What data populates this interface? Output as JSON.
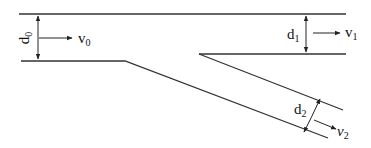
{
  "diagram": {
    "type": "branching channel flow",
    "labels": {
      "d0": {
        "main": "d",
        "sub": "0"
      },
      "v0": {
        "main": "v",
        "sub": "0"
      },
      "d1": {
        "main": "d",
        "sub": "1"
      },
      "v1": {
        "main": "v",
        "sub": "1"
      },
      "d2": {
        "main": "d",
        "sub": "2"
      },
      "v2": {
        "main": "v",
        "sub": "2"
      }
    },
    "colors": {
      "line": "#333333",
      "text": "#111111",
      "background": "#ffffff"
    }
  }
}
